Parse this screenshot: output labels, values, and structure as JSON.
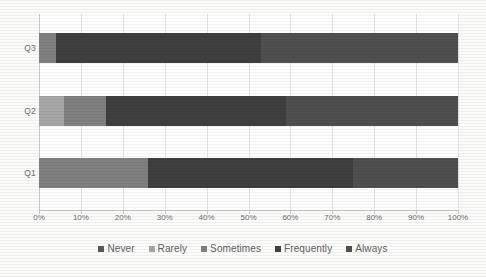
{
  "chart_data": {
    "type": "bar",
    "subtype": "stacked-horizontal-100-percent",
    "title": "",
    "xlabel": "",
    "ylabel": "",
    "categories": [
      "Q1",
      "Q2",
      "Q3"
    ],
    "category_order_top_to_bottom": [
      "Q3",
      "Q2",
      "Q1"
    ],
    "xlim": [
      0,
      100
    ],
    "xticks": [
      0,
      10,
      20,
      30,
      40,
      50,
      60,
      70,
      80,
      90,
      100
    ],
    "xtick_labels": [
      "0%",
      "10%",
      "20%",
      "30%",
      "40%",
      "50%",
      "60%",
      "70%",
      "80%",
      "90%",
      "100%"
    ],
    "grid": true,
    "legend_position": "bottom",
    "series": [
      {
        "name": "Never",
        "color": "#595959",
        "values": [
          0,
          0,
          0
        ]
      },
      {
        "name": "Rarely",
        "color": "#a6a6a6",
        "values": [
          0,
          6,
          0
        ]
      },
      {
        "name": "Sometimes",
        "color": "#808080",
        "values": [
          26,
          10,
          4
        ]
      },
      {
        "name": "Frequently",
        "color": "#3f3f3f",
        "values": [
          49,
          43,
          49
        ]
      },
      {
        "name": "Always",
        "color": "#4f4f4f",
        "values": [
          25,
          41,
          47
        ]
      }
    ]
  },
  "axis": {
    "y_labels": [
      "Q3",
      "Q2",
      "Q1"
    ],
    "x_labels": [
      "0%",
      "10%",
      "20%",
      "30%",
      "40%",
      "50%",
      "60%",
      "70%",
      "80%",
      "90%",
      "100%"
    ]
  },
  "legend": {
    "items": [
      {
        "label": "Never",
        "color": "#595959"
      },
      {
        "label": "Rarely",
        "color": "#a6a6a6"
      },
      {
        "label": "Sometimes",
        "color": "#808080"
      },
      {
        "label": "Frequently",
        "color": "#3f3f3f"
      },
      {
        "label": "Always",
        "color": "#4f4f4f"
      }
    ]
  },
  "bars": {
    "Q3": [
      {
        "series": "Rarely",
        "start": 0,
        "end": 0,
        "color": "#a6a6a6"
      },
      {
        "series": "Sometimes",
        "start": 0,
        "end": 4,
        "color": "#808080"
      },
      {
        "series": "Frequently",
        "start": 4,
        "end": 53,
        "color": "#3f3f3f"
      },
      {
        "series": "Always",
        "start": 53,
        "end": 100,
        "color": "#4f4f4f"
      }
    ],
    "Q2": [
      {
        "series": "Rarely",
        "start": 0,
        "end": 6,
        "color": "#a6a6a6"
      },
      {
        "series": "Sometimes",
        "start": 6,
        "end": 16,
        "color": "#808080"
      },
      {
        "series": "Frequently",
        "start": 16,
        "end": 59,
        "color": "#3f3f3f"
      },
      {
        "series": "Always",
        "start": 59,
        "end": 100,
        "color": "#4f4f4f"
      }
    ],
    "Q1": [
      {
        "series": "Sometimes",
        "start": 0,
        "end": 26,
        "color": "#808080"
      },
      {
        "series": "Frequently",
        "start": 26,
        "end": 75,
        "color": "#3f3f3f"
      },
      {
        "series": "Always",
        "start": 75,
        "end": 100,
        "color": "#4f4f4f"
      }
    ]
  }
}
